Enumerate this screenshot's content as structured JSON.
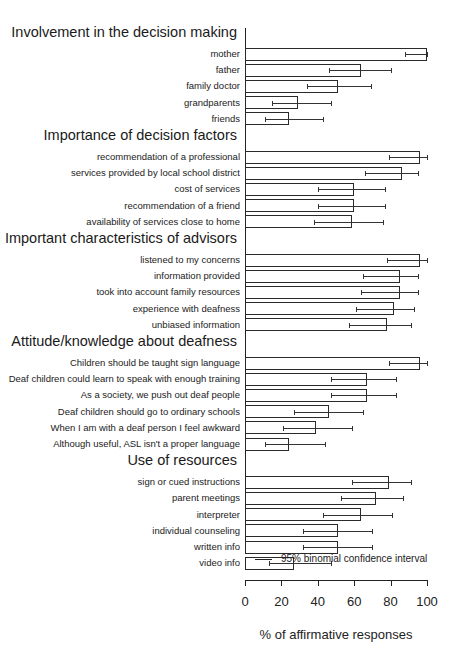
{
  "chart_data": {
    "type": "bar",
    "orientation": "horizontal",
    "title": "",
    "xlabel": "% of affirmative responses",
    "ylabel": "",
    "xlim": [
      0,
      100
    ],
    "xticks": [
      "0",
      "20",
      "40",
      "60",
      "80",
      "100"
    ],
    "grid": false,
    "legend": {
      "label": "95% binomial confidence interval",
      "position": "bottom-right above x-axis"
    },
    "groups": [
      {
        "title": "Involvement in the decision making",
        "items": [
          {
            "label": "mother",
            "value": 100,
            "ci": [
              88,
              100
            ]
          },
          {
            "label": "father",
            "value": 64,
            "ci": [
              46,
              80
            ]
          },
          {
            "label": "family doctor",
            "value": 51,
            "ci": [
              34,
              69
            ]
          },
          {
            "label": "grandparents",
            "value": 29,
            "ci": [
              15,
              47
            ]
          },
          {
            "label": "friends",
            "value": 24,
            "ci": [
              11,
              43
            ]
          }
        ]
      },
      {
        "title": "Importance of decision factors",
        "items": [
          {
            "label": "recommendation of a professional",
            "value": 96,
            "ci": [
              79,
              100
            ]
          },
          {
            "label": "services provided by local school district",
            "value": 86,
            "ci": [
              66,
              95
            ]
          },
          {
            "label": "cost of services",
            "value": 60,
            "ci": [
              40,
              77
            ]
          },
          {
            "label": "recommendation of a friend",
            "value": 60,
            "ci": [
              40,
              77
            ]
          },
          {
            "label": "availability of services close to home",
            "value": 59,
            "ci": [
              38,
              76
            ]
          }
        ]
      },
      {
        "title": "Important characteristics of advisors",
        "items": [
          {
            "label": "listened to my concerns",
            "value": 96,
            "ci": [
              78,
              100
            ]
          },
          {
            "label": "information provided",
            "value": 85,
            "ci": [
              65,
              95
            ]
          },
          {
            "label": "took into account family resources",
            "value": 85,
            "ci": [
              64,
              95
            ]
          },
          {
            "label": "experience with deafness",
            "value": 82,
            "ci": [
              61,
              93
            ]
          },
          {
            "label": "unbiased information",
            "value": 78,
            "ci": [
              57,
              91
            ]
          }
        ]
      },
      {
        "title": "Attitude/knowledge about deafness",
        "items": [
          {
            "label": "Children should be taught sign language",
            "value": 96,
            "ci": [
              79,
              100
            ]
          },
          {
            "label": "Deaf children could learn to speak with enough training",
            "value": 67,
            "ci": [
              47,
              83
            ]
          },
          {
            "label": "As a society, we push out deaf people",
            "value": 67,
            "ci": [
              47,
              83
            ]
          },
          {
            "label": "Deaf children should go to ordinary schools",
            "value": 46,
            "ci": [
              27,
              65
            ]
          },
          {
            "label": "When I am with a deaf person I feel awkward",
            "value": 39,
            "ci": [
              21,
              59
            ]
          },
          {
            "label": "Although useful, ASL isn't a proper language",
            "value": 24,
            "ci": [
              11,
              44
            ]
          }
        ]
      },
      {
        "title": "Use of resources",
        "items": [
          {
            "label": "sign or cued instructions",
            "value": 79,
            "ci": [
              59,
              91
            ]
          },
          {
            "label": "parent meetings",
            "value": 72,
            "ci": [
              53,
              87
            ]
          },
          {
            "label": "interpreter",
            "value": 64,
            "ci": [
              43,
              81
            ]
          },
          {
            "label": "individual counseling",
            "value": 51,
            "ci": [
              32,
              70
            ]
          },
          {
            "label": "written info",
            "value": 51,
            "ci": [
              32,
              70
            ]
          },
          {
            "label": "video info",
            "value": 27,
            "ci": [
              13,
              47
            ]
          }
        ]
      }
    ]
  },
  "axis": {
    "xlabel": "% of affirmative responses",
    "ticks": [
      "0",
      "20",
      "40",
      "60",
      "80",
      "100"
    ]
  },
  "legend": {
    "label": "95% binomial confidence interval"
  }
}
